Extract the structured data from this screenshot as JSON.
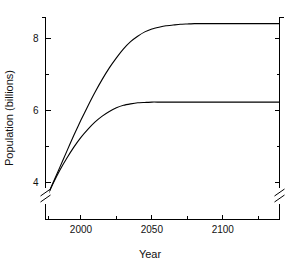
{
  "chart_data": {
    "type": "line",
    "title": "",
    "subtitle": "",
    "xlabel": "Year",
    "ylabel": "Population (billions)",
    "xlim": [
      1975,
      2140
    ],
    "ylim": [
      3.3,
      8.9
    ],
    "y_axis_break": true,
    "y_break_below": 3.9,
    "grid": false,
    "legend": false,
    "legend_position": "none",
    "x_major_ticks": [
      2000,
      2050,
      2100
    ],
    "x_major_tick_labels": [
      "2000",
      "2050",
      "2100"
    ],
    "x_minor_ticks": [
      1977,
      2025,
      2075,
      2125
    ],
    "y_major_ticks": [
      4,
      6,
      8
    ],
    "y_major_tick_labels": [
      "4",
      "6",
      "8"
    ],
    "y_minor_ticks": [
      5,
      7
    ],
    "line_color": "#000000",
    "background_color": "#ffffff",
    "series": [
      {
        "name": "high-projection",
        "x": [
          1975,
          1980,
          1985,
          1990,
          1995,
          2000,
          2005,
          2010,
          2015,
          2020,
          2025,
          2030,
          2035,
          2040,
          2045,
          2050,
          2055,
          2060,
          2065,
          2070,
          2075,
          2080,
          2085,
          2090,
          2095,
          2100,
          2110,
          2120,
          2130,
          2140
        ],
        "values": [
          3.5,
          3.95,
          4.4,
          4.85,
          5.3,
          5.72,
          6.12,
          6.5,
          6.85,
          7.17,
          7.45,
          7.7,
          7.9,
          8.05,
          8.17,
          8.25,
          8.3,
          8.34,
          8.36,
          8.38,
          8.39,
          8.4,
          8.4,
          8.4,
          8.4,
          8.4,
          8.4,
          8.4,
          8.4,
          8.4
        ]
      },
      {
        "name": "low-projection",
        "x": [
          1975,
          1980,
          1985,
          1990,
          1995,
          2000,
          2005,
          2010,
          2015,
          2020,
          2025,
          2030,
          2035,
          2040,
          2045,
          2050,
          2055,
          2060,
          2065,
          2070,
          2075,
          2080,
          2085,
          2090,
          2095,
          2100,
          2110,
          2120,
          2130,
          2140
        ],
        "values": [
          3.5,
          3.93,
          4.32,
          4.66,
          4.97,
          5.24,
          5.47,
          5.67,
          5.83,
          5.96,
          6.06,
          6.13,
          6.17,
          6.2,
          6.21,
          6.22,
          6.22,
          6.22,
          6.22,
          6.22,
          6.22,
          6.22,
          6.22,
          6.22,
          6.22,
          6.22,
          6.22,
          6.22,
          6.22,
          6.22
        ]
      }
    ]
  }
}
